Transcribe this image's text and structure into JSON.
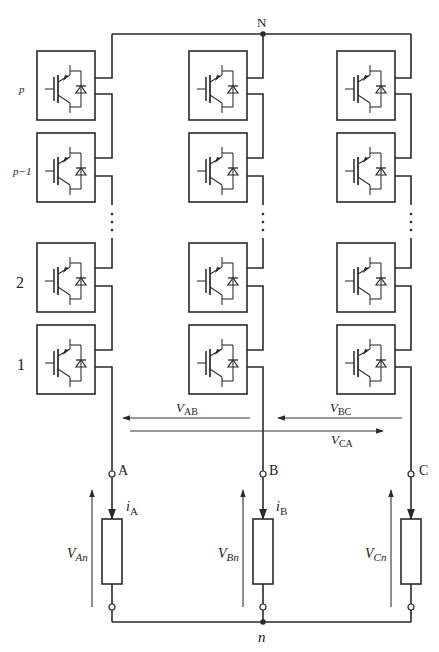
{
  "nodes": {
    "neutral_top": "N",
    "neutral_load": "n"
  },
  "row_labels": [
    "p",
    "p−1",
    "2",
    "1"
  ],
  "phases": [
    {
      "terminal": "A",
      "current_main": "i",
      "current_sub": "A",
      "voltage_main": "V",
      "voltage_sub": "An"
    },
    {
      "terminal": "B",
      "current_main": "i",
      "current_sub": "B",
      "voltage_main": "V",
      "voltage_sub": "Bn"
    },
    {
      "terminal": "C",
      "current_main": "",
      "current_sub": "",
      "voltage_main": "V",
      "voltage_sub": "Cn"
    }
  ],
  "line_voltages": [
    {
      "main": "V",
      "sub": "AB",
      "direction": "left"
    },
    {
      "main": "V",
      "sub": "BC",
      "direction": "left"
    },
    {
      "main": "V",
      "sub": "CA",
      "direction": "right"
    }
  ],
  "cell": {
    "component": "IGBT with anti-parallel diode",
    "icon": "igbt-diode-icon"
  },
  "ellipsis": "⋮",
  "colors": {
    "line": "#2a2a2a",
    "background": "#ffffff"
  }
}
